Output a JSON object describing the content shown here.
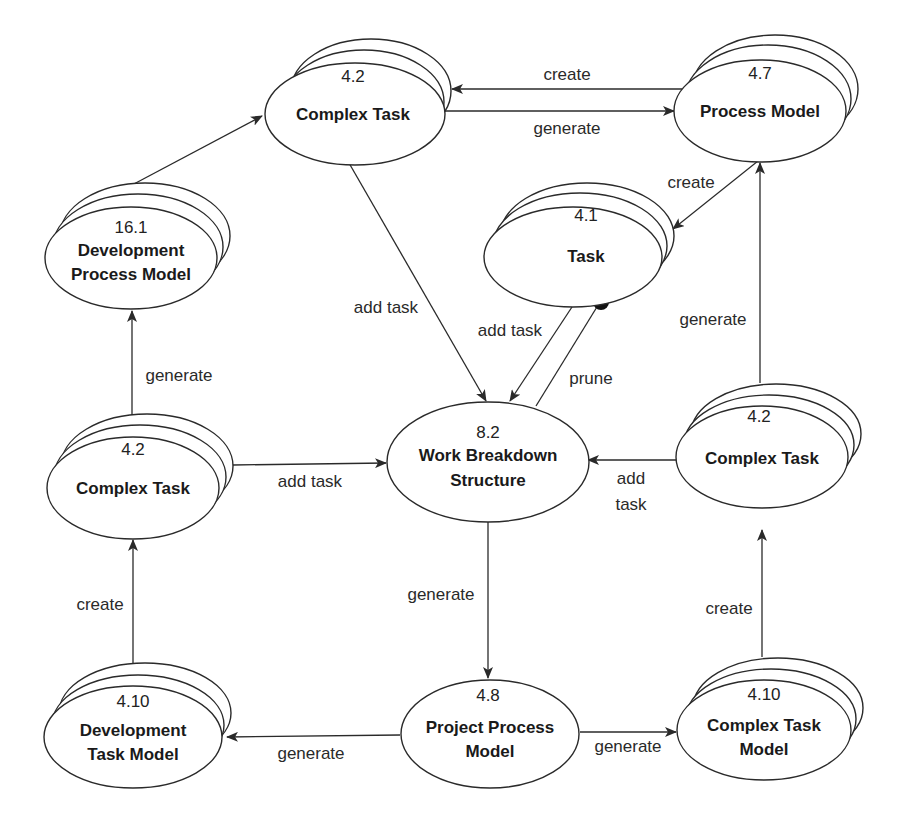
{
  "diagram": {
    "nodes": {
      "complex_task_top": {
        "id": "4.2",
        "line1": "Complex Task",
        "line2": "",
        "stacked": true
      },
      "process_model": {
        "id": "4.7",
        "line1": "Process Model",
        "line2": "",
        "stacked": true
      },
      "dev_process_model": {
        "id": "16.1",
        "line1": "Development",
        "line2": "Process Model",
        "stacked": true
      },
      "task": {
        "id": "4.1",
        "line1": "Task",
        "line2": "",
        "stacked": true
      },
      "complex_task_left": {
        "id": "4.2",
        "line1": "Complex Task",
        "line2": "",
        "stacked": true
      },
      "wbs": {
        "id": "8.2",
        "line1": "Work Breakdown",
        "line2": "Structure",
        "stacked": false
      },
      "complex_task_right": {
        "id": "4.2",
        "line1": "Complex Task",
        "line2": "",
        "stacked": true
      },
      "dev_task_model": {
        "id": "4.10",
        "line1": "Development",
        "line2": "Task Model",
        "stacked": true
      },
      "project_process_model": {
        "id": "4.8",
        "line1": "Project Process",
        "line2": "Model",
        "stacked": false
      },
      "complex_task_model": {
        "id": "4.10",
        "line1": "Complex Task",
        "line2": "Model",
        "stacked": true
      }
    },
    "edges": {
      "pm_to_ct_top": {
        "from": "Process Model",
        "to": "Complex Task (4.2)",
        "label": "create"
      },
      "ct_top_to_pm": {
        "from": "Complex Task (4.2)",
        "to": "Process Model",
        "label": "generate"
      },
      "pm_to_task": {
        "from": "Process Model",
        "to": "Task",
        "label": "create"
      },
      "ct_top_to_wbs": {
        "from": "Complex Task (4.2)",
        "to": "Work Breakdown Structure",
        "label": "add task"
      },
      "task_to_wbs": {
        "from": "Task",
        "to": "Work Breakdown Structure",
        "label": "add task"
      },
      "wbs_prune_task": {
        "from": "Work Breakdown Structure",
        "to": "Task",
        "label": "prune"
      },
      "ct_right_to_pm": {
        "from": "Complex Task (4.2)",
        "to": "Process Model",
        "label": "generate"
      },
      "dpm_to_ct_top": {
        "from": "Development Process Model",
        "to": "Complex Task (4.2)",
        "label": ""
      },
      "ct_left_to_dpm": {
        "from": "Complex Task (4.2)",
        "to": "Development Process Model",
        "label": "generate"
      },
      "ct_left_to_wbs": {
        "from": "Complex Task (4.2)",
        "to": "Work Breakdown Structure",
        "label": "add task"
      },
      "ct_right_to_wbs": {
        "from": "Complex Task (4.2)",
        "to": "Work Breakdown Structure",
        "label_line1": "add",
        "label_line2": "task"
      },
      "wbs_to_ppm": {
        "from": "Work Breakdown Structure",
        "to": "Project Process Model",
        "label": "generate"
      },
      "dtm_to_ct_left": {
        "from": "Development Task Model",
        "to": "Complex Task (4.2)",
        "label": "create"
      },
      "ctm_to_ct_right": {
        "from": "Complex Task Model",
        "to": "Complex Task (4.2)",
        "label": "create"
      },
      "ppm_to_dtm": {
        "from": "Project Process Model",
        "to": "Development Task Model",
        "label": "generate"
      },
      "ppm_to_ctm": {
        "from": "Project Process Model",
        "to": "Complex Task Model",
        "label": "generate"
      }
    }
  }
}
